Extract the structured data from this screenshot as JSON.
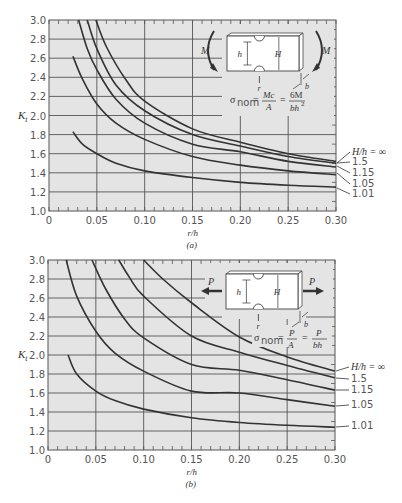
{
  "chart_data": [
    {
      "type": "line",
      "panel": "a",
      "caption": "(a)",
      "title": "",
      "xlabel": "r/h",
      "ylabel": "K_t",
      "xlim": [
        0,
        0.3
      ],
      "ylim": [
        1.0,
        3.0
      ],
      "xticks": [
        0,
        0.05,
        0.1,
        0.15,
        0.2,
        0.25,
        0.3
      ],
      "xtick_labels": [
        "0",
        "0.05",
        "0.10",
        "0.15",
        "0.20",
        "0.25",
        "0.30"
      ],
      "yticks": [
        1.0,
        1.2,
        1.4,
        1.6,
        1.8,
        2.0,
        2.2,
        2.4,
        2.6,
        2.8,
        3.0
      ],
      "ytick_labels": [
        "1.0",
        "1.2",
        "1.4",
        "1.6",
        "1.8",
        "2.0",
        "2.2",
        "2.4",
        "2.6",
        "2.8",
        "3.0"
      ],
      "grid": true,
      "legend_title": "H/h = ∞",
      "inset": {
        "load": "M",
        "load_type": "bending",
        "dims": [
          "h",
          "H",
          "r",
          "b"
        ],
        "formula": "σnom = Mc/A = 6M/bh²"
      },
      "series": [
        {
          "name": "H/h = ∞",
          "x": [
            0.049,
            0.06,
            0.08,
            0.1,
            0.15,
            0.2,
            0.25,
            0.3
          ],
          "y": [
            3.0,
            2.72,
            2.38,
            2.15,
            1.86,
            1.72,
            1.6,
            1.52
          ]
        },
        {
          "name": "1.5",
          "x": [
            0.04,
            0.05,
            0.07,
            0.1,
            0.15,
            0.2,
            0.25,
            0.3
          ],
          "y": [
            3.0,
            2.7,
            2.32,
            2.05,
            1.8,
            1.68,
            1.57,
            1.5
          ]
        },
        {
          "name": "1.15",
          "x": [
            0.031,
            0.04,
            0.05,
            0.07,
            0.1,
            0.15,
            0.2,
            0.25,
            0.3
          ],
          "y": [
            3.0,
            2.7,
            2.48,
            2.17,
            1.92,
            1.7,
            1.62,
            1.52,
            1.46
          ]
        },
        {
          "name": "1.05",
          "x": [
            0.025,
            0.035,
            0.05,
            0.07,
            0.1,
            0.15,
            0.2,
            0.25,
            0.3
          ],
          "y": [
            2.62,
            2.38,
            2.12,
            1.92,
            1.75,
            1.57,
            1.48,
            1.42,
            1.38
          ]
        },
        {
          "name": "1.01",
          "x": [
            0.025,
            0.035,
            0.05,
            0.07,
            0.1,
            0.15,
            0.2,
            0.25,
            0.3
          ],
          "y": [
            1.83,
            1.7,
            1.6,
            1.5,
            1.42,
            1.35,
            1.3,
            1.27,
            1.25
          ]
        }
      ]
    },
    {
      "type": "line",
      "panel": "b",
      "caption": "(b)",
      "title": "",
      "xlabel": "r/h",
      "ylabel": "K_t",
      "xlim": [
        0,
        0.3
      ],
      "ylim": [
        1.0,
        3.0
      ],
      "xticks": [
        0,
        0.05,
        0.1,
        0.15,
        0.2,
        0.25,
        0.3
      ],
      "xtick_labels": [
        "0",
        "0.05",
        "0.10",
        "0.15",
        "0.20",
        "0.25",
        "0.30"
      ],
      "yticks": [
        1.0,
        1.2,
        1.4,
        1.6,
        1.8,
        2.0,
        2.2,
        2.4,
        2.6,
        2.8,
        3.0
      ],
      "ytick_labels": [
        "1.0",
        "1.2",
        "1.4",
        "1.6",
        "1.8",
        "2.0",
        "2.2",
        "2.4",
        "2.6",
        "2.8",
        "3.0"
      ],
      "grid": true,
      "legend_title": "H/h = ∞",
      "inset": {
        "load": "P",
        "load_type": "axial tension",
        "dims": [
          "h",
          "H",
          "r",
          "b"
        ],
        "formula": "σnom = P/A = P/bh"
      },
      "series": [
        {
          "name": "H/h = ∞",
          "x": [
            0.1,
            0.12,
            0.15,
            0.2,
            0.25,
            0.3
          ],
          "y": [
            3.0,
            2.8,
            2.55,
            2.19,
            1.98,
            1.83
          ]
        },
        {
          "name": "1.5",
          "x": [
            0.074,
            0.085,
            0.1,
            0.15,
            0.2,
            0.25,
            0.3
          ],
          "y": [
            3.0,
            2.82,
            2.62,
            2.2,
            2.03,
            1.89,
            1.76
          ]
        },
        {
          "name": "1.15",
          "x": [
            0.046,
            0.06,
            0.08,
            0.1,
            0.15,
            0.2,
            0.25,
            0.3
          ],
          "y": [
            3.0,
            2.7,
            2.38,
            2.18,
            1.9,
            1.84,
            1.74,
            1.63
          ]
        },
        {
          "name": "1.05",
          "x": [
            0.019,
            0.03,
            0.05,
            0.07,
            0.1,
            0.15,
            0.2,
            0.25,
            0.3
          ],
          "y": [
            3.0,
            2.62,
            2.25,
            2.02,
            1.83,
            1.62,
            1.6,
            1.53,
            1.46
          ]
        },
        {
          "name": "1.01",
          "x": [
            0.021,
            0.03,
            0.05,
            0.07,
            0.1,
            0.15,
            0.2,
            0.25,
            0.3
          ],
          "y": [
            2.0,
            1.8,
            1.62,
            1.52,
            1.43,
            1.34,
            1.29,
            1.26,
            1.24
          ]
        }
      ]
    }
  ],
  "labels": {
    "ylabel": "K",
    "ylabel_sub": "t",
    "xlabel": "r/h",
    "caption_a": "(a)",
    "caption_b": "(b)",
    "legend": [
      "H/h = ∞",
      "1.5",
      "1.15",
      "1.05",
      "1.01"
    ],
    "inset_a": {
      "load": "M",
      "h": "h",
      "H": "H",
      "r": "r",
      "b": "b",
      "sigma": "σ",
      "nom": "nom",
      "eq1_num": "Mc",
      "eq1_den": "A",
      "eq2_num": "6M",
      "eq2_den": "bh",
      "eq2_sup": "2"
    },
    "inset_b": {
      "load": "P",
      "h": "h",
      "H": "H",
      "r": "r",
      "b": "b",
      "sigma": "σ",
      "nom": "nom",
      "eq1_num": "P",
      "eq1_den": "A",
      "eq2_num": "P",
      "eq2_den": "bh"
    }
  },
  "colors": {
    "plot_bg": "#e4e4e4",
    "grid": "#555555",
    "curve": "#333333",
    "text": "#555555"
  }
}
